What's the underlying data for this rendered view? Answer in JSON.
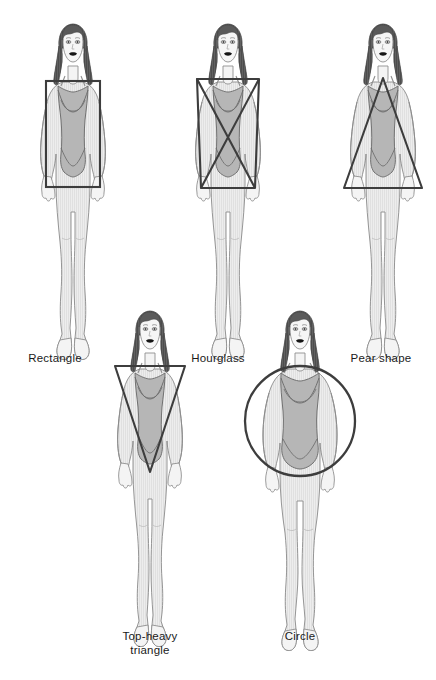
{
  "page": {
    "background_color": "#ffffff",
    "width": 436,
    "height": 680
  },
  "palette": {
    "outline": "#5a5a5a",
    "skin_fill": "#f2f2f2",
    "body_shade": "#e2e2e2",
    "swimsuit_fill": "#b3b3b3",
    "hair_dark": "#4e4e4e",
    "hair_mid": "#6e6e6e",
    "lips": "#111111",
    "overlay_stroke": "#3d3d3d",
    "label_color": "#1a1a1a"
  },
  "figures": [
    {
      "id": "rectangle",
      "label": "Rectangle",
      "overlay_shape": "rectangle",
      "row": 1,
      "column": 1
    },
    {
      "id": "hourglass",
      "label": "Hourglass",
      "overlay_shape": "bowtie",
      "row": 1,
      "column": 2
    },
    {
      "id": "pear-shape",
      "label": "Pear shape",
      "overlay_shape": "triangle-up",
      "row": 1,
      "column": 3
    },
    {
      "id": "top-heavy-triangle",
      "label": "Top-heavy\ntriangle",
      "overlay_shape": "triangle-down",
      "row": 2,
      "column": 1
    },
    {
      "id": "circle",
      "label": "Circle",
      "overlay_shape": "circle",
      "row": 2,
      "column": 2
    }
  ],
  "labels": {
    "rectangle": "Rectangle",
    "hourglass": "Hourglass",
    "pear_shape": "Pear shape",
    "top_heavy_triangle": "Top-heavy\ntriangle",
    "circle": "Circle"
  }
}
